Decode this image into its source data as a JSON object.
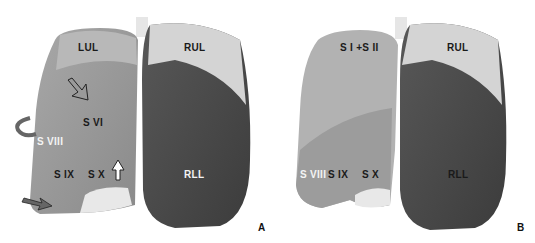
{
  "figure": {
    "panels": [
      {
        "id": "A",
        "label": "A",
        "labels": {
          "lul": "LUL",
          "rul": "RUL",
          "rll": "RLL",
          "s6": "S VI",
          "s8": "S VIII",
          "s9": "S IX",
          "s10": "S X"
        },
        "arrows": [
          "open-arrow-down-right",
          "curved-arrow",
          "white-arrow-up",
          "filled-arrow-right"
        ]
      },
      {
        "id": "B",
        "label": "B",
        "labels": {
          "s1s2": "S I +S II",
          "rul": "RUL",
          "rll": "RLL",
          "s8": "S VIII",
          "s9": "S IX",
          "s10": "S X"
        }
      }
    ],
    "colors": {
      "upper_lobe": "#d4d4d4",
      "left_lower": "#9a9a9a",
      "right_lower": "#4a4a4a",
      "trachea": "#e6e6e6"
    }
  }
}
